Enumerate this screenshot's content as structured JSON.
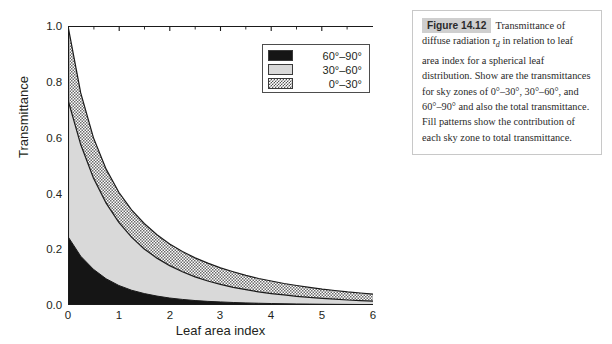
{
  "figure": {
    "badge": "Figure 14.12",
    "caption_parts": {
      "p1": "Transmittance of diffuse radiation ",
      "tau": "τ",
      "tau_sub": "d",
      "p2": " in relation to leaf area index for a spherical leaf distribution. Show are the transmittances for sky zones of 0°–30°, 30°–60°, and 60°–90° and also the total transmittance. Fill patterns show the contribution of each sky zone to total transmittance."
    },
    "caption_full": "Transmittance of diffuse radiation τd in relation to leaf area index for a spherical leaf distribution. Show are the transmittances for sky zones of 0°–30°, 30°–60°, and 60°–90° and also the total transmittance. Fill patterns show the contribution of each sky zone to total transmittance."
  },
  "legend": {
    "entries": [
      {
        "label": "60°–90°",
        "fill": "black",
        "color": "#151515"
      },
      {
        "label": "30°–60°",
        "fill": "gray",
        "color": "#d9d9d9"
      },
      {
        "label": "0°–30°",
        "fill": "dotted",
        "color": "#ffffff"
      }
    ]
  },
  "axes": {
    "xlabel": "Leaf area index",
    "ylabel": "Transmittance",
    "xticks": [
      "0",
      "1",
      "2",
      "3",
      "4",
      "5",
      "6"
    ],
    "yticks": [
      "0.0",
      "0.2",
      "0.4",
      "0.6",
      "0.8",
      "1.0"
    ]
  },
  "chart_data": {
    "type": "area",
    "title": "",
    "xlabel": "Leaf area index",
    "ylabel": "Transmittance",
    "xlim": [
      0,
      6
    ],
    "ylim": [
      0,
      1.0
    ],
    "grid": false,
    "legend_position": "top-right",
    "x": [
      0,
      0.25,
      0.5,
      0.75,
      1.0,
      1.25,
      1.5,
      1.75,
      2.0,
      2.25,
      2.5,
      2.75,
      3.0,
      3.25,
      3.5,
      3.75,
      4.0,
      4.25,
      4.5,
      4.75,
      5.0,
      5.25,
      5.5,
      5.75,
      6.0
    ],
    "series": [
      {
        "name": "60°–90°",
        "fill": "black",
        "description": "cumulative upper boundary of the 60-90 degree sky zone band (lowest band)",
        "values": [
          0.245,
          0.175,
          0.128,
          0.094,
          0.07,
          0.053,
          0.041,
          0.032,
          0.025,
          0.02,
          0.016,
          0.013,
          0.011,
          0.009,
          0.0075,
          0.0063,
          0.0053,
          0.0045,
          0.0038,
          0.0033,
          0.0028,
          0.0024,
          0.0021,
          0.0018,
          0.0016
        ]
      },
      {
        "name": "30°–60°",
        "fill": "gray",
        "description": "cumulative upper boundary of 60-90 plus 30-60 sky zones",
        "values": [
          0.735,
          0.575,
          0.455,
          0.365,
          0.296,
          0.243,
          0.201,
          0.168,
          0.141,
          0.119,
          0.101,
          0.086,
          0.074,
          0.063,
          0.055,
          0.047,
          0.041,
          0.036,
          0.031,
          0.027,
          0.024,
          0.021,
          0.018,
          0.016,
          0.014
        ]
      },
      {
        "name": "0°–30°",
        "fill": "dotted",
        "description": "total transmittance, cumulative upper boundary of all three sky zones",
        "values": [
          1.0,
          0.76,
          0.6,
          0.487,
          0.404,
          0.341,
          0.292,
          0.252,
          0.219,
          0.192,
          0.169,
          0.15,
          0.133,
          0.119,
          0.106,
          0.095,
          0.086,
          0.077,
          0.07,
          0.063,
          0.057,
          0.052,
          0.047,
          0.043,
          0.039
        ]
      }
    ]
  }
}
